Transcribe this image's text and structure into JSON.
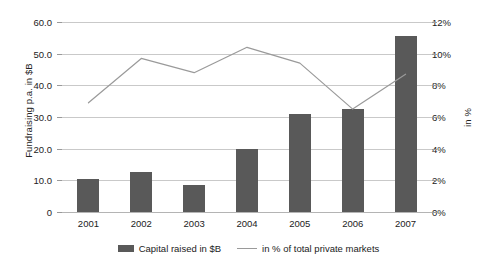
{
  "chart_data": {
    "type": "bar",
    "title": "",
    "subtitle": "",
    "categories": [
      "2001",
      "2002",
      "2003",
      "2004",
      "2005",
      "2006",
      "2007"
    ],
    "xlabel": "",
    "ylabel": "Fundraising p.a. in $B",
    "ylabel_secondary": "in %",
    "ylim": [
      0,
      60
    ],
    "ylim_secondary": [
      0,
      12
    ],
    "grid": true,
    "legend_position": "bottom",
    "y_ticks": [
      "0",
      "10.0",
      "20.0",
      "30.0",
      "40.0",
      "50.0",
      "60.0"
    ],
    "y_tick_values": [
      0,
      10,
      20,
      30,
      40,
      50,
      60
    ],
    "y_ticks_secondary": [
      "0%",
      "2%",
      "4%",
      "6%",
      "8%",
      "10%",
      "12%"
    ],
    "y_tick_values_secondary": [
      0,
      2,
      4,
      6,
      8,
      10,
      12
    ],
    "series": [
      {
        "name": "Capital raised in $B",
        "type": "bar",
        "axis": "left",
        "color": "#595959",
        "values": [
          10.5,
          12.5,
          8.5,
          20.0,
          31.0,
          32.5,
          55.5
        ]
      },
      {
        "name": "in % of total private markets",
        "type": "line",
        "axis": "right",
        "color": "#9a9a9a",
        "values": [
          6.9,
          9.7,
          8.8,
          10.4,
          9.4,
          6.5,
          8.7
        ]
      }
    ]
  },
  "legend": {
    "bar_label": "Capital raised in $B",
    "line_label": "in % of total private markets"
  }
}
